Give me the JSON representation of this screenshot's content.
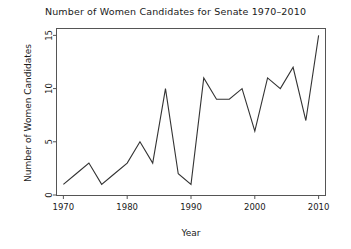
{
  "chart_data": {
    "type": "line",
    "title": "Number of Women Candidates for Senate 1970–2010",
    "xlabel": "Year",
    "ylabel": "Number of Women Candidates",
    "x": [
      1970,
      1972,
      1974,
      1976,
      1978,
      1980,
      1982,
      1984,
      1986,
      1988,
      1990,
      1992,
      1994,
      1996,
      1998,
      2000,
      2002,
      2004,
      2006,
      2008,
      2010
    ],
    "values": [
      1,
      2,
      3,
      1,
      2,
      3,
      5,
      3,
      10,
      2,
      1,
      11,
      9,
      9,
      10,
      6,
      11,
      10,
      12,
      7,
      15
    ],
    "xlim": [
      1969,
      2011
    ],
    "ylim": [
      0,
      15.6
    ],
    "xticks": [
      1970,
      1980,
      1990,
      2000,
      2010
    ],
    "xtick_labels": [
      "1970",
      "1980",
      "1990",
      "2000",
      "2010"
    ],
    "yticks": [
      0,
      5,
      10,
      15
    ],
    "ytick_labels": [
      "0",
      "5",
      "10",
      "15"
    ],
    "grid": false,
    "legend": null,
    "line_color": "#333333",
    "frame_color": "#555555",
    "background": "#ffffff"
  }
}
